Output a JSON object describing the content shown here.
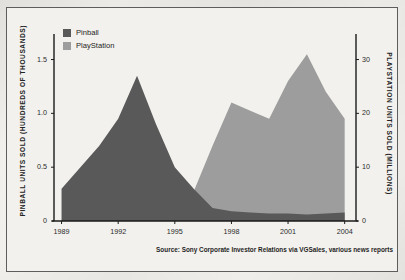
{
  "figure": {
    "source_note": "Source: Sony Corporate Investor Relations via VGSales, various news reports"
  },
  "legend": {
    "items": [
      {
        "label": "Pinball",
        "color": "#595959",
        "name": "legend-pinball"
      },
      {
        "label": "PlayStation",
        "color": "#9d9d9d",
        "name": "legend-playstation"
      }
    ]
  },
  "colors": {
    "pinball": "#595959",
    "playstation": "#9d9d9d",
    "axis": "#1a1a1a",
    "frame": "#5d5d5d",
    "plot_background": "#f2f1ed",
    "page_background": "#f1f0ec"
  },
  "chart_data": {
    "type": "area",
    "title": "",
    "xlabel": "",
    "grid": false,
    "legend_position": "top-left",
    "x": [
      1989,
      1990,
      1991,
      1992,
      1993,
      1994,
      1995,
      1996,
      1997,
      1998,
      1999,
      2000,
      2001,
      2002,
      2003,
      2004
    ],
    "xlim": [
      1988.6,
      2004.6
    ],
    "xticks": [
      1989,
      1992,
      1995,
      1998,
      2001,
      2004
    ],
    "xticklabels": [
      "1989",
      "1992",
      "1995",
      "1998",
      "2001",
      "2004"
    ],
    "axes": [
      {
        "id": "left",
        "label": "PINBALL UNITS SOLD (HUNDREDS OF THOUSANDS)",
        "ylim": [
          0,
          1.7
        ],
        "ticks": [
          0,
          0.5,
          1.0,
          1.5
        ],
        "ticklabels": [
          "0",
          "0.5",
          "1.0",
          "1.5"
        ]
      },
      {
        "id": "right",
        "label": "PLAYSTATION UNITS SOLD (MILLIONS)",
        "ylim": [
          0,
          34
        ],
        "ticks": [
          0,
          10,
          20,
          30
        ],
        "ticklabels": [
          "0",
          "10",
          "20",
          "30"
        ]
      }
    ],
    "series": [
      {
        "name": "Pinball",
        "axis": "left",
        "units": "hundreds of thousands",
        "color": "#595959",
        "values": [
          0.3,
          0.5,
          0.7,
          0.95,
          1.35,
          0.9,
          0.5,
          0.3,
          0.12,
          0.09,
          0.08,
          0.07,
          0.07,
          0.06,
          0.07,
          0.08
        ]
      },
      {
        "name": "PlayStation",
        "axis": "right",
        "units": "millions",
        "color": "#9d9d9d",
        "values": [
          0,
          0,
          0,
          0,
          0,
          0,
          1.0,
          5.5,
          14.0,
          22.0,
          20.5,
          19.0,
          26.0,
          31.0,
          24.0,
          19.0
        ]
      }
    ]
  }
}
